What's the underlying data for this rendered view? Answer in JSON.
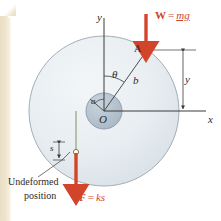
{
  "figure": {
    "type": "physics-free-body-diagram",
    "background_color": "#ffffff",
    "page_edge_color": "#e8dfc4"
  },
  "axes": {
    "y_label": "y",
    "x_label": "x",
    "origin_label": "O"
  },
  "bodies": {
    "outer_disk": {
      "name": "outer-disk",
      "center_x": 104,
      "center_y": 111,
      "radius": 75,
      "fill": "#e9eef2",
      "stroke": "#9aa5ad"
    },
    "inner_hub": {
      "name": "inner-hub",
      "center_x": 104,
      "center_y": 111,
      "radius": 18,
      "fill": "#b9c6d1",
      "stroke": "#8d9aa6"
    }
  },
  "points": {
    "A": {
      "label": "A",
      "x": 147,
      "y": 50
    },
    "O": {
      "label": "O",
      "x": 104,
      "y": 111
    }
  },
  "dimensions": {
    "radius_inner": "a",
    "radius_to_A": "b",
    "angle": "θ",
    "height_y": "y",
    "spring_stretch": "s"
  },
  "forces": {
    "weight": {
      "label_prefix": "W",
      "label_equals": "=",
      "label_value": "mg",
      "color": "#d2452a",
      "direction": "down",
      "applied_at": "A"
    },
    "spring": {
      "label_prefix": "F",
      "label_equals": "=",
      "label_value": "ks",
      "color": "#d2452a",
      "direction": "down",
      "applied_at": "spring-end"
    }
  },
  "annotations": {
    "undeformed_line1": "Undeformed",
    "undeformed_line2": "position"
  }
}
